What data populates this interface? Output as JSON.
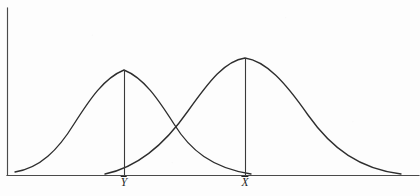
{
  "figure": {
    "background_color": "#fdfdfd",
    "ink_color": "#2e2e2e",
    "axis_color": "#4a4a4a"
  },
  "labels": {
    "y_mean": "Y",
    "x_mean": "X",
    "y_mean_full": "Ȳ",
    "x_mean_full": "X̄"
  },
  "chart_data": {
    "type": "line",
    "title": "",
    "subtitle": "",
    "xlabel": "",
    "ylabel": "",
    "grid": false,
    "legend_position": "none",
    "axis": {
      "origin_x": 7,
      "baseline_y": 175,
      "y_axis_top": 8,
      "x_axis_right": 419,
      "xlim": [
        0,
        420
      ],
      "ylim": [
        0,
        196
      ]
    },
    "annotations": [
      {
        "name": "y-mean-marker",
        "label": "Ȳ",
        "x": 124,
        "peak_y": 70,
        "baseline_y": 175,
        "label_x": 124,
        "label_y": 177
      },
      {
        "name": "x-mean-marker",
        "label": "X̄",
        "x": 245,
        "peak_y": 58,
        "baseline_y": 175,
        "label_x": 245,
        "label_y": 177
      }
    ],
    "series": [
      {
        "name": "Y distribution",
        "mean_label": "Ȳ",
        "mean_x": 124,
        "peak_y": 70,
        "peak_height": 105,
        "spread": 42,
        "x_start": 15,
        "x_end": 251,
        "path": "M 15,172 C 40,168 58,150 74,124 C 90,99 104,78 124,70 C 144,78 158,99 174,124 C 190,150 212,168 251,174"
      },
      {
        "name": "X distribution",
        "mean_label": "X̄",
        "mean_x": 245,
        "peak_y": 58,
        "peak_height": 117,
        "spread": 58,
        "x_start": 105,
        "x_end": 401,
        "path": "M 105,174 C 139,167 165,144 188,111 C 210,80 225,61 245,58 C 266,61 285,82 308,115 C 332,149 360,169 401,174"
      }
    ],
    "intersection": {
      "x": 170,
      "y": 102
    }
  }
}
